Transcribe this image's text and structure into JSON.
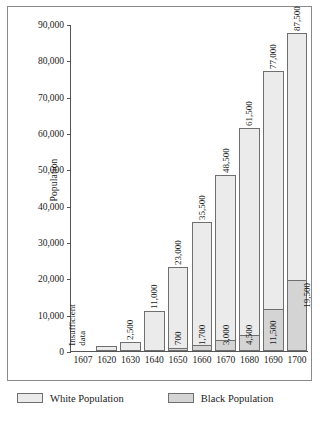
{
  "chart_data": {
    "type": "bar",
    "title": "",
    "xlabel": "",
    "ylabel": "Population",
    "ylim": [
      0,
      90000
    ],
    "ytick_step": 10000,
    "ytick_labels": [
      "0",
      "10,000",
      "20,000",
      "30,000",
      "40,000",
      "50,000",
      "60,000",
      "70,000",
      "80,000",
      "90,000"
    ],
    "grid": false,
    "stacked": true,
    "legend_position": "bottom",
    "categories": [
      "1607",
      "1620",
      "1630",
      "1640",
      "1650",
      "1660",
      "1670",
      "1680",
      "1690",
      "1700"
    ],
    "series": [
      {
        "name": "White Population",
        "color": "#ebebeb",
        "values": [
          null,
          1300,
          2500,
          11000,
          23000,
          35500,
          48500,
          61500,
          77000,
          87500
        ],
        "labels": [
          "",
          "",
          "2,500",
          "11,000",
          "23,000",
          "35,500",
          "48,500",
          "61,500",
          "77,000",
          "87,500"
        ]
      },
      {
        "name": "Black Population",
        "color": "#d4d4d4",
        "values": [
          null,
          null,
          null,
          null,
          700,
          1700,
          3000,
          4500,
          11500,
          19500
        ],
        "labels": [
          "",
          "",
          "",
          "",
          "700",
          "1,700",
          "3,000",
          "4,500",
          "11,500",
          "19,500"
        ]
      }
    ],
    "annotations": [
      {
        "category": "1607",
        "text_line1": "Insufficient",
        "text_line2": "data"
      }
    ]
  },
  "legend": {
    "white_label": "White Population",
    "black_label": "Black Population"
  }
}
